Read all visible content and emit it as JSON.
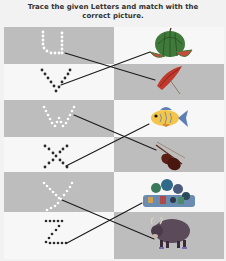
{
  "instructions": {
    "line1": "Trace the given Letters and match with the",
    "line2": "correct picture."
  },
  "rows": [
    {
      "letter": "U",
      "letter_style": "dotted-white",
      "left_bg": "gray",
      "picture": "watermelon",
      "right_bg": "white"
    },
    {
      "letter": "V",
      "letter_style": "dotted-black",
      "left_bg": "white",
      "picture": "umbrella",
      "right_bg": "gray"
    },
    {
      "letter": "W",
      "letter_style": "dotted-white",
      "left_bg": "gray",
      "picture": "fish",
      "right_bg": "white"
    },
    {
      "letter": "X",
      "letter_style": "dotted-black",
      "left_bg": "white",
      "picture": "violin",
      "right_bg": "gray"
    },
    {
      "letter": "Y",
      "letter_style": "dotted-white",
      "left_bg": "gray",
      "picture": "xylophone-toys",
      "right_bg": "white"
    },
    {
      "letter": "Z",
      "letter_style": "dotted-black",
      "left_bg": "white",
      "picture": "yak",
      "right_bg": "gray"
    }
  ],
  "matches": [
    {
      "from": "U",
      "to": "umbrella"
    },
    {
      "from": "V",
      "to": "watermelon"
    },
    {
      "from": "W",
      "to": "violin"
    },
    {
      "from": "X",
      "to": "fish"
    },
    {
      "from": "Y",
      "to": "yak"
    },
    {
      "from": "Z",
      "to": "xylophone-toys"
    }
  ],
  "colors": {
    "gray_cell": "#bdbdbd",
    "white_cell": "#f7f7f7",
    "line": "#1a1a1a"
  }
}
